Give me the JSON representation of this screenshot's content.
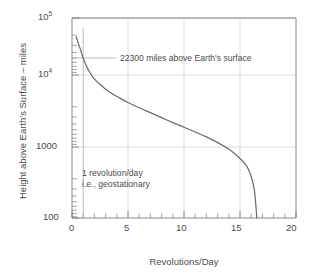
{
  "chart_data": {
    "type": "line",
    "title": "",
    "xlabel": "Revolutions/Day",
    "ylabel": "Height above Earth's Surface – miles",
    "xlim": [
      0,
      20
    ],
    "ylim": [
      100,
      100000
    ],
    "yscale": "log",
    "xscale": "linear",
    "grid": true,
    "legend": null,
    "xticks": [
      "0",
      "5",
      "10",
      "15",
      "20"
    ],
    "xtick_values": [
      0,
      5,
      10,
      15,
      20
    ],
    "xtick_minor_step": 1,
    "yticks": [
      "10^5",
      "10^4",
      "1000",
      "100"
    ],
    "ytick_values": [
      100000,
      10000,
      1000,
      100
    ],
    "ytick_display": [
      {
        "mantissa": "10",
        "exponent": "5"
      },
      {
        "mantissa": "10",
        "exponent": "4"
      },
      {
        "plain": "1000"
      },
      {
        "plain": "100"
      }
    ],
    "series": [
      {
        "name": "Orbit altitude vs revolutions per day",
        "x": [
          0.38,
          0.5,
          0.62,
          0.75,
          0.9,
          1.0,
          1.15,
          1.35,
          1.6,
          1.9,
          2.2,
          2.6,
          3.1,
          3.6,
          4.2,
          5.0,
          6.0,
          7.0,
          8.0,
          9.0,
          10.0,
          11.0,
          12.0,
          13.0,
          14.0,
          15.0,
          15.6,
          16.0,
          16.3,
          16.5
        ],
        "y": [
          52000,
          45000,
          39000,
          34000,
          28000,
          25000,
          21500,
          18000,
          15200,
          12800,
          11200,
          9800,
          8300,
          7300,
          6400,
          5400,
          4500,
          3800,
          3200,
          2700,
          2300,
          1950,
          1650,
          1350,
          1080,
          780,
          600,
          420,
          250,
          100
        ]
      }
    ],
    "annotations": [
      {
        "id": "altitude-annotation",
        "text": "22300 miles above Earth's surface",
        "leader_from": {
          "x": 0.0,
          "y": 22300
        },
        "leader_to": {
          "x": 1.6,
          "y": 22300
        }
      },
      {
        "id": "geostationary-annotation",
        "line1": "1 revolution/day",
        "line2": "i.e., geostationary",
        "marker_line_x": 1.0
      }
    ],
    "reference_lines": [
      {
        "id": "geostationary-vertical",
        "orientation": "vertical",
        "x": 1.0,
        "from_y": 62000,
        "to_y": 100
      },
      {
        "id": "altitude-horizontal",
        "orientation": "horizontal",
        "y": 22300,
        "from_x": 0.0,
        "to_x": 1.6
      }
    ],
    "colors": {
      "curve": "#6b6b6b",
      "axis": "#7d7d7d",
      "grid": "#c8c8c8",
      "text": "#4c4c4c",
      "background": "#ffffff",
      "annotation_line": "#9a9a9a"
    }
  }
}
